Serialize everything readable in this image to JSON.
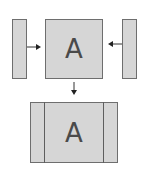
{
  "diagram": {
    "top_row": {
      "left_strip": {
        "label": ""
      },
      "center_panel": {
        "label": "A"
      },
      "right_strip": {
        "label": ""
      }
    },
    "result": {
      "panel_label": "A",
      "segments": [
        "left-strip",
        "center-A",
        "right-strip"
      ]
    },
    "arrows": [
      {
        "from": "left_strip",
        "to": "center_panel",
        "direction": "right"
      },
      {
        "from": "right_strip",
        "to": "center_panel",
        "direction": "left"
      },
      {
        "from": "center_panel",
        "to": "result",
        "direction": "down"
      }
    ],
    "colors": {
      "fill": "#d6d6d6",
      "stroke": "#6e6e6e",
      "arrow": "#333333",
      "text": "#4a4a4a"
    }
  }
}
